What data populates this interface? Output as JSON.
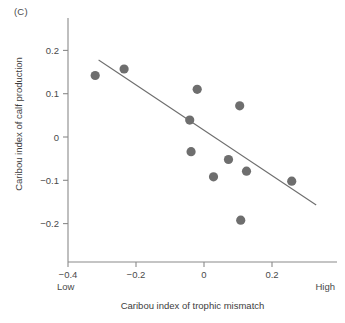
{
  "panel": {
    "label": "(C)"
  },
  "chart_data": {
    "type": "scatter",
    "title": "",
    "xlabel": "Caribou index of trophic mismatch",
    "ylabel": "Caribou index of calf production",
    "xlim": [
      -0.47,
      0.36
    ],
    "ylim": [
      -0.27,
      0.25
    ],
    "grid": false,
    "legend": null,
    "xticks": [
      -0.4,
      -0.2,
      0,
      0.2
    ],
    "xticklabels": [
      "−0.4",
      "−0.2",
      "0",
      "0.2"
    ],
    "yticks": [
      0.2,
      0.1,
      0,
      -0.1,
      -0.2
    ],
    "yticklabels": [
      "0.2",
      "0.1",
      "0",
      "−0.1",
      "−0.2"
    ],
    "x_axis_end_labels": {
      "low": "Low",
      "high": "High"
    },
    "point_color": "#6e6e6e",
    "line_color": "#6e6e6e",
    "points": [
      {
        "x": -0.32,
        "y": 0.142
      },
      {
        "x": -0.235,
        "y": 0.157
      },
      {
        "x": -0.02,
        "y": 0.11
      },
      {
        "x": 0.105,
        "y": 0.072
      },
      {
        "x": -0.042,
        "y": 0.039
      },
      {
        "x": -0.038,
        "y": -0.034
      },
      {
        "x": 0.072,
        "y": -0.052
      },
      {
        "x": 0.125,
        "y": -0.079
      },
      {
        "x": 0.028,
        "y": -0.092
      },
      {
        "x": 0.258,
        "y": -0.102
      },
      {
        "x": 0.108,
        "y": -0.192
      }
    ],
    "trend_line": {
      "x1": -0.31,
      "y1": 0.178,
      "x2": 0.33,
      "y2": -0.157
    }
  }
}
